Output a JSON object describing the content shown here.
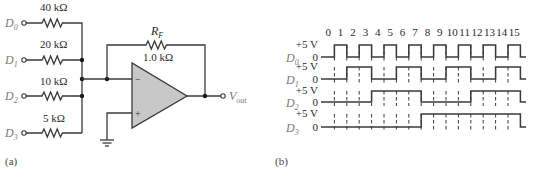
{
  "figure_a": {
    "caption": "(a)",
    "inputs": [
      {
        "label": "D",
        "sub": "0",
        "resistor": "40 kΩ"
      },
      {
        "label": "D",
        "sub": "1",
        "resistor": "20 kΩ"
      },
      {
        "label": "D",
        "sub": "2",
        "resistor": "10 kΩ"
      },
      {
        "label": "D",
        "sub": "3",
        "resistor": "5 kΩ"
      }
    ],
    "feedback": {
      "label": "R",
      "sub": "F",
      "value": "1.0 kΩ"
    },
    "opamp": {
      "inverting": "−",
      "noninverting": "+"
    },
    "output": {
      "label": "V",
      "sub": "out"
    }
  },
  "figure_b": {
    "caption": "(b)",
    "slot_labels": [
      "0",
      "1",
      "2",
      "3",
      "4",
      "5",
      "6",
      "7",
      "8",
      "9",
      "10",
      "11",
      "12",
      "13",
      "14",
      "15"
    ],
    "high_label": "+5 V",
    "low_label": "0",
    "signals": [
      {
        "label": "D",
        "sub": "0",
        "bits": [
          0,
          1,
          0,
          1,
          0,
          1,
          0,
          1,
          0,
          1,
          0,
          1,
          0,
          1,
          0,
          1
        ]
      },
      {
        "label": "D",
        "sub": "1",
        "bits": [
          0,
          0,
          1,
          1,
          0,
          0,
          1,
          1,
          0,
          0,
          1,
          1,
          0,
          0,
          1,
          1
        ]
      },
      {
        "label": "D",
        "sub": "2",
        "bits": [
          0,
          0,
          0,
          0,
          1,
          1,
          1,
          1,
          0,
          0,
          0,
          0,
          1,
          1,
          1,
          1
        ]
      },
      {
        "label": "D",
        "sub": "3",
        "bits": [
          0,
          0,
          0,
          0,
          0,
          0,
          0,
          0,
          1,
          1,
          1,
          1,
          1,
          1,
          1,
          1
        ]
      }
    ]
  }
}
